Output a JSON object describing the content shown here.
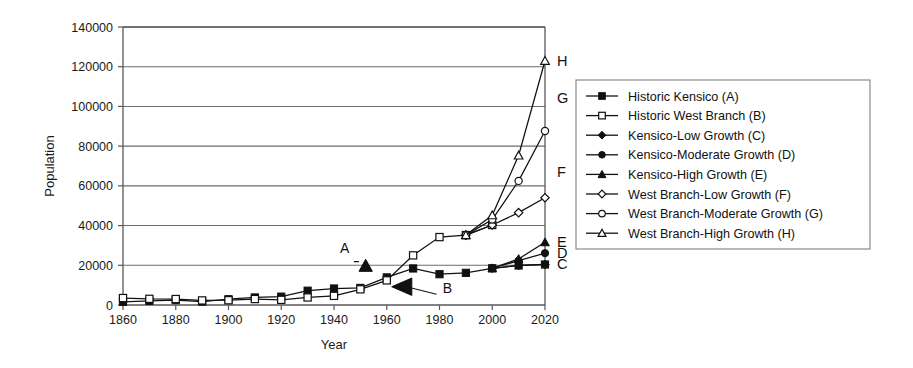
{
  "chart_data": {
    "type": "line",
    "title": "",
    "xlabel": "Year",
    "ylabel": "Population",
    "xlim": [
      1860,
      2020
    ],
    "ylim": [
      0,
      140000
    ],
    "xticks": [
      1860,
      1880,
      1900,
      1920,
      1940,
      1960,
      1980,
      2000,
      2020
    ],
    "yticks": [
      0,
      20000,
      40000,
      60000,
      80000,
      100000,
      120000,
      140000
    ],
    "grid": "horizontal",
    "legend_position": "right-outside",
    "series": [
      {
        "name": "Historic Kensico (A)",
        "key": "A",
        "marker": "filled-square",
        "end_label": "",
        "x": [
          1860,
          1870,
          1880,
          1890,
          1900,
          1910,
          1920,
          1930,
          1940,
          1950,
          1960,
          1970,
          1980,
          1990,
          2000,
          2010,
          2020
        ],
        "values": [
          1600,
          2100,
          2500,
          1700,
          2900,
          3800,
          4200,
          7200,
          8300,
          8600,
          13900,
          18400,
          15500,
          16200,
          18500,
          19900,
          20400
        ]
      },
      {
        "name": "Historic West Branch (B)",
        "key": "B",
        "marker": "open-square",
        "end_label": "",
        "x": [
          1860,
          1870,
          1880,
          1890,
          1900,
          1910,
          1920,
          1930,
          1940,
          1950,
          1960,
          1970,
          1980,
          1990,
          2000
        ],
        "values": [
          3500,
          3100,
          3000,
          2300,
          2400,
          3000,
          2600,
          3800,
          4600,
          7900,
          12400,
          25000,
          34200,
          35200,
          40300
        ]
      },
      {
        "name": "Kensico-Low Growth (C)",
        "key": "C",
        "marker": "filled-diamond",
        "end_label": "C",
        "x": [
          2000,
          2010,
          2020
        ],
        "values": [
          18500,
          19900,
          20400
        ]
      },
      {
        "name": "Kensico-Moderate Growth (D)",
        "key": "D",
        "marker": "filled-circle",
        "end_label": "D",
        "x": [
          2000,
          2010,
          2020
        ],
        "values": [
          18500,
          22300,
          26100
        ]
      },
      {
        "name": "Kensico-High Growth (E)",
        "key": "E",
        "marker": "filled-triangle",
        "end_label": "E",
        "x": [
          2000,
          2010,
          2020
        ],
        "values": [
          18500,
          23200,
          31600
        ]
      },
      {
        "name": "West Branch-Low Growth (F)",
        "key": "F",
        "marker": "open-diamond",
        "end_label": "F",
        "x": [
          1990,
          2000,
          2010,
          2020
        ],
        "values": [
          35200,
          40300,
          46500,
          54000
        ]
      },
      {
        "name": "West Branch-Moderate Growth (G)",
        "key": "G",
        "marker": "open-circle",
        "end_label": "G",
        "x": [
          1990,
          2000,
          2010,
          2020
        ],
        "values": [
          35200,
          43000,
          62500,
          87600
        ]
      },
      {
        "name": "West Branch-High Growth (H)",
        "key": "H",
        "marker": "open-triangle",
        "end_label": "H",
        "x": [
          1990,
          2000,
          2010,
          2020
        ],
        "values": [
          35200,
          45200,
          75300,
          123000
        ]
      }
    ],
    "annotations": [
      {
        "label": "A",
        "text_x": 1944,
        "text_y": 26200,
        "point_x": 1952,
        "point_y": 19700,
        "marker": "filled-triangle"
      },
      {
        "label": "B",
        "text_x": 1983,
        "text_y": 6200,
        "point_x": 1966,
        "point_y": 9200,
        "marker": "filled-triangle-left"
      }
    ]
  },
  "legend": {
    "items": [
      {
        "label": "Historic Kensico (A)",
        "marker": "filled-square"
      },
      {
        "label": "Historic West Branch (B)",
        "marker": "open-square"
      },
      {
        "label": "Kensico-Low Growth (C)",
        "marker": "filled-diamond"
      },
      {
        "label": "Kensico-Moderate Growth (D)",
        "marker": "filled-circle"
      },
      {
        "label": "Kensico-High Growth (E)",
        "marker": "filled-triangle"
      },
      {
        "label": "West Branch-Low Growth (F)",
        "marker": "open-diamond"
      },
      {
        "label": "West Branch-Moderate Growth (G)",
        "marker": "open-circle"
      },
      {
        "label": "West Branch-High Growth (H)",
        "marker": "open-triangle"
      }
    ]
  },
  "colors": {
    "ink": "#111111",
    "axis": "#58585a",
    "grid": "#6d6d6f",
    "background": "#ffffff"
  }
}
